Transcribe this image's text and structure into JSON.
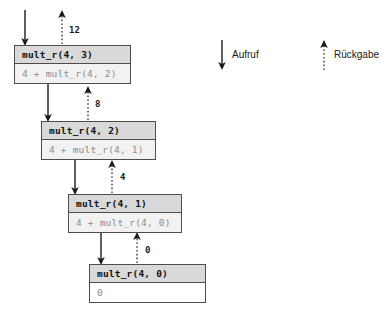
{
  "diagram": {
    "frames": [
      {
        "head": "mult_r(4, 3)",
        "body": "4 + mult_r(4, 2)",
        "base_case": false
      },
      {
        "head": "mult_r(4, 2)",
        "body": "4 + mult_r(4, 1)",
        "base_case": false
      },
      {
        "head": "mult_r(4, 1)",
        "body": "4 + mult_r(4, 0)",
        "base_case": false
      },
      {
        "head": "mult_r(4, 0)",
        "body": "0",
        "base_case": true
      }
    ],
    "return_values": [
      "12",
      "8",
      "4",
      "0"
    ],
    "legend": {
      "call_label": "Aufruf",
      "return_label": "Rückgabe"
    },
    "colors": {
      "header_fill": "#d9d9d9",
      "body_fill": "#f2f2f2",
      "border": "#4d4d4d",
      "arrow": "#1a1a1a",
      "body_text": "#8c8c8c",
      "head_text": "#101010"
    }
  }
}
